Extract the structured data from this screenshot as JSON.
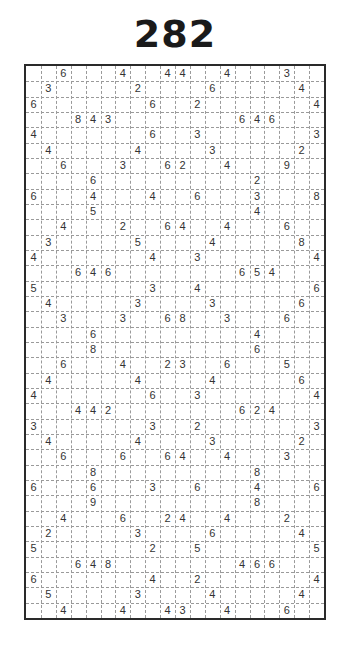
{
  "puzzle": {
    "title": "282",
    "type": "Shikaku",
    "cols": 20,
    "rows": 36,
    "clues": [
      [
        0,
        2,
        6
      ],
      [
        0,
        6,
        4
      ],
      [
        0,
        9,
        4
      ],
      [
        0,
        10,
        4
      ],
      [
        0,
        13,
        4
      ],
      [
        0,
        17,
        3
      ],
      [
        1,
        1,
        3
      ],
      [
        1,
        7,
        2
      ],
      [
        1,
        12,
        6
      ],
      [
        1,
        18,
        4
      ],
      [
        2,
        0,
        6
      ],
      [
        2,
        8,
        6
      ],
      [
        2,
        11,
        2
      ],
      [
        2,
        19,
        4
      ],
      [
        3,
        3,
        8
      ],
      [
        3,
        4,
        4
      ],
      [
        3,
        5,
        3
      ],
      [
        3,
        14,
        6
      ],
      [
        3,
        15,
        4
      ],
      [
        3,
        16,
        6
      ],
      [
        4,
        0,
        4
      ],
      [
        4,
        8,
        6
      ],
      [
        4,
        11,
        3
      ],
      [
        4,
        19,
        3
      ],
      [
        5,
        1,
        4
      ],
      [
        5,
        7,
        4
      ],
      [
        5,
        12,
        3
      ],
      [
        5,
        18,
        2
      ],
      [
        6,
        2,
        6
      ],
      [
        6,
        6,
        3
      ],
      [
        6,
        9,
        6
      ],
      [
        6,
        10,
        2
      ],
      [
        6,
        13,
        4
      ],
      [
        6,
        17,
        9
      ],
      [
        7,
        4,
        6
      ],
      [
        7,
        15,
        2
      ],
      [
        8,
        0,
        6
      ],
      [
        8,
        4,
        4
      ],
      [
        8,
        8,
        4
      ],
      [
        8,
        11,
        6
      ],
      [
        8,
        15,
        3
      ],
      [
        8,
        19,
        8
      ],
      [
        9,
        4,
        5
      ],
      [
        9,
        15,
        4
      ],
      [
        10,
        2,
        4
      ],
      [
        10,
        6,
        2
      ],
      [
        10,
        9,
        6
      ],
      [
        10,
        10,
        4
      ],
      [
        10,
        13,
        4
      ],
      [
        10,
        17,
        6
      ],
      [
        11,
        1,
        3
      ],
      [
        11,
        7,
        5
      ],
      [
        11,
        12,
        4
      ],
      [
        11,
        18,
        8
      ],
      [
        12,
        0,
        4
      ],
      [
        12,
        8,
        4
      ],
      [
        12,
        11,
        3
      ],
      [
        12,
        19,
        4
      ],
      [
        13,
        3,
        6
      ],
      [
        13,
        4,
        4
      ],
      [
        13,
        5,
        6
      ],
      [
        13,
        14,
        6
      ],
      [
        13,
        15,
        5
      ],
      [
        13,
        16,
        4
      ],
      [
        14,
        0,
        5
      ],
      [
        14,
        8,
        3
      ],
      [
        14,
        11,
        4
      ],
      [
        14,
        19,
        6
      ],
      [
        15,
        1,
        4
      ],
      [
        15,
        7,
        3
      ],
      [
        15,
        12,
        3
      ],
      [
        15,
        18,
        6
      ],
      [
        16,
        2,
        3
      ],
      [
        16,
        6,
        3
      ],
      [
        16,
        9,
        6
      ],
      [
        16,
        10,
        8
      ],
      [
        16,
        13,
        3
      ],
      [
        16,
        17,
        6
      ],
      [
        17,
        4,
        6
      ],
      [
        17,
        15,
        4
      ],
      [
        18,
        4,
        8
      ],
      [
        18,
        15,
        6
      ],
      [
        19,
        2,
        6
      ],
      [
        19,
        6,
        4
      ],
      [
        19,
        9,
        2
      ],
      [
        19,
        10,
        3
      ],
      [
        19,
        13,
        6
      ],
      [
        19,
        17,
        5
      ],
      [
        20,
        1,
        4
      ],
      [
        20,
        7,
        4
      ],
      [
        20,
        12,
        4
      ],
      [
        20,
        18,
        6
      ],
      [
        21,
        0,
        4
      ],
      [
        21,
        8,
        6
      ],
      [
        21,
        11,
        3
      ],
      [
        21,
        19,
        4
      ],
      [
        22,
        3,
        4
      ],
      [
        22,
        4,
        4
      ],
      [
        22,
        5,
        2
      ],
      [
        22,
        14,
        6
      ],
      [
        22,
        15,
        2
      ],
      [
        22,
        16,
        4
      ],
      [
        23,
        0,
        3
      ],
      [
        23,
        8,
        3
      ],
      [
        23,
        11,
        2
      ],
      [
        23,
        19,
        3
      ],
      [
        24,
        1,
        4
      ],
      [
        24,
        7,
        4
      ],
      [
        24,
        12,
        3
      ],
      [
        24,
        18,
        2
      ],
      [
        25,
        2,
        6
      ],
      [
        25,
        6,
        6
      ],
      [
        25,
        9,
        6
      ],
      [
        25,
        10,
        4
      ],
      [
        25,
        13,
        4
      ],
      [
        25,
        17,
        3
      ],
      [
        26,
        4,
        8
      ],
      [
        26,
        15,
        8
      ],
      [
        27,
        0,
        6
      ],
      [
        27,
        4,
        6
      ],
      [
        27,
        8,
        3
      ],
      [
        27,
        11,
        6
      ],
      [
        27,
        15,
        4
      ],
      [
        27,
        19,
        6
      ],
      [
        28,
        4,
        9
      ],
      [
        28,
        15,
        8
      ],
      [
        29,
        2,
        4
      ],
      [
        29,
        6,
        6
      ],
      [
        29,
        9,
        2
      ],
      [
        29,
        10,
        4
      ],
      [
        29,
        13,
        4
      ],
      [
        29,
        17,
        2
      ],
      [
        30,
        1,
        2
      ],
      [
        30,
        7,
        3
      ],
      [
        30,
        12,
        6
      ],
      [
        30,
        18,
        4
      ],
      [
        31,
        0,
        5
      ],
      [
        31,
        8,
        2
      ],
      [
        31,
        11,
        5
      ],
      [
        31,
        19,
        5
      ],
      [
        32,
        3,
        6
      ],
      [
        32,
        4,
        4
      ],
      [
        32,
        5,
        8
      ],
      [
        32,
        14,
        4
      ],
      [
        32,
        15,
        6
      ],
      [
        32,
        16,
        6
      ],
      [
        33,
        0,
        6
      ],
      [
        33,
        8,
        4
      ],
      [
        33,
        11,
        2
      ],
      [
        33,
        19,
        4
      ],
      [
        34,
        1,
        5
      ],
      [
        34,
        7,
        3
      ],
      [
        34,
        12,
        4
      ],
      [
        34,
        18,
        4
      ],
      [
        35,
        2,
        4
      ],
      [
        35,
        6,
        4
      ],
      [
        35,
        9,
        4
      ],
      [
        35,
        10,
        3
      ],
      [
        35,
        13,
        4
      ],
      [
        35,
        17,
        6
      ]
    ]
  },
  "colors": {
    "line": "#2a2a2a",
    "dashed": "#9a9a9a",
    "text": "#333333",
    "background": "#ffffff"
  }
}
